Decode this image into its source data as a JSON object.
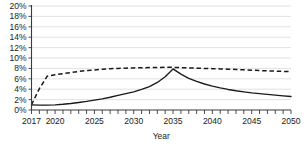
{
  "chart_data": {
    "type": "line",
    "title": "",
    "subtitle": "",
    "xlabel": "Year",
    "ylabel": "",
    "grid": true,
    "legend": "none",
    "xlim": [
      2017,
      2050
    ],
    "ylim": [
      0,
      0.2
    ],
    "ytick_labels": [
      "20%",
      "18%",
      "16%",
      "14%",
      "12%",
      "10%",
      "8%",
      "6%",
      "4%",
      "2%",
      "0%"
    ],
    "ytick_values": [
      20,
      18,
      16,
      14,
      12,
      10,
      8,
      6,
      4,
      2,
      0
    ],
    "xtick_labels": [
      "2017",
      "2020",
      "2025",
      "2030",
      "2035",
      "2040",
      "2045",
      "2050"
    ],
    "xtick_values": [
      2017,
      2020,
      2025,
      2030,
      2035,
      2040,
      2045,
      2050
    ],
    "x": [
      2017,
      2018,
      2019,
      2020,
      2021,
      2022,
      2023,
      2024,
      2025,
      2026,
      2027,
      2028,
      2029,
      2030,
      2031,
      2032,
      2033,
      2034,
      2035,
      2036,
      2037,
      2038,
      2039,
      2040,
      2041,
      2042,
      2043,
      2044,
      2045,
      2046,
      2047,
      2048,
      2049,
      2050
    ],
    "series": [
      {
        "name": "dashed-series",
        "style": "dashed",
        "values": [
          1.0,
          4.1,
          6.5,
          6.8,
          7.0,
          7.2,
          7.4,
          7.6,
          7.7,
          7.85,
          7.95,
          8.0,
          8.05,
          8.1,
          8.13,
          8.16,
          8.18,
          8.2,
          8.2,
          8.15,
          8.1,
          8.05,
          8.0,
          7.95,
          7.9,
          7.85,
          7.8,
          7.72,
          7.65,
          7.58,
          7.52,
          7.47,
          7.43,
          7.4
        ]
      },
      {
        "name": "solid-series",
        "style": "solid",
        "values": [
          1.0,
          0.95,
          0.95,
          1.0,
          1.1,
          1.25,
          1.45,
          1.65,
          1.9,
          2.15,
          2.45,
          2.8,
          3.15,
          3.5,
          3.95,
          4.5,
          5.3,
          6.4,
          7.9,
          6.9,
          6.1,
          5.5,
          5.0,
          4.6,
          4.25,
          3.95,
          3.7,
          3.5,
          3.3,
          3.15,
          3.0,
          2.85,
          2.72,
          2.6
        ]
      }
    ]
  },
  "colors": {
    "line": "#1a1a1a",
    "grid": "#d4d4d4",
    "axis": "#3a3a3a",
    "background": "#ffffff"
  }
}
